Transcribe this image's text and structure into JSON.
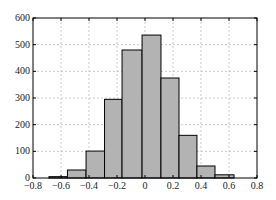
{
  "chart_data": {
    "type": "bar",
    "subtype": "histogram",
    "title": "",
    "xlabel": "",
    "ylabel": "",
    "xlim": [
      -0.8,
      0.8
    ],
    "ylim": [
      0,
      600
    ],
    "xticks": [
      -0.8,
      -0.6,
      -0.4,
      -0.2,
      0,
      0.2,
      0.4,
      0.6,
      0.8
    ],
    "xtick_labels": [
      "-0.8",
      "-0.6",
      "-0.4",
      "-0.2",
      "0",
      "0.2",
      "0.4",
      "0.6",
      "0.8"
    ],
    "yticks": [
      0,
      100,
      200,
      300,
      400,
      500,
      600
    ],
    "ytick_labels": [
      "0",
      "100",
      "200",
      "300",
      "400",
      "500",
      "600"
    ],
    "grid": true,
    "grid_style": "dashed",
    "legend": null,
    "bin_edges": [
      -0.686,
      -0.554,
      -0.421,
      -0.289,
      -0.164,
      -0.021,
      0.114,
      0.243,
      0.371,
      0.5,
      0.636
    ],
    "values": [
      5,
      30,
      101,
      295,
      480,
      536,
      375,
      160,
      45,
      12
    ],
    "bar_color": "#b3b3b3",
    "edge_color": "#000000"
  }
}
